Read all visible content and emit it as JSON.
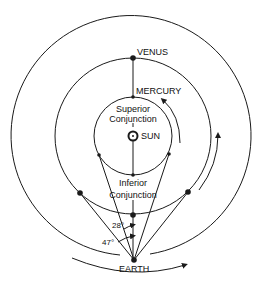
{
  "diagram": {
    "labels": {
      "venus": "VENUS",
      "mercury": "MERCURY",
      "superior_1": "Superior",
      "superior_2": "Conjunction",
      "sun": "SUN",
      "inferior_1": "Inferior",
      "inferior_2": "Conjunction",
      "angle_28": "28°",
      "angle_47": "47°",
      "earth": "EARTH"
    },
    "colors": {
      "line": "#1a1a1a",
      "background": "#ffffff"
    }
  }
}
